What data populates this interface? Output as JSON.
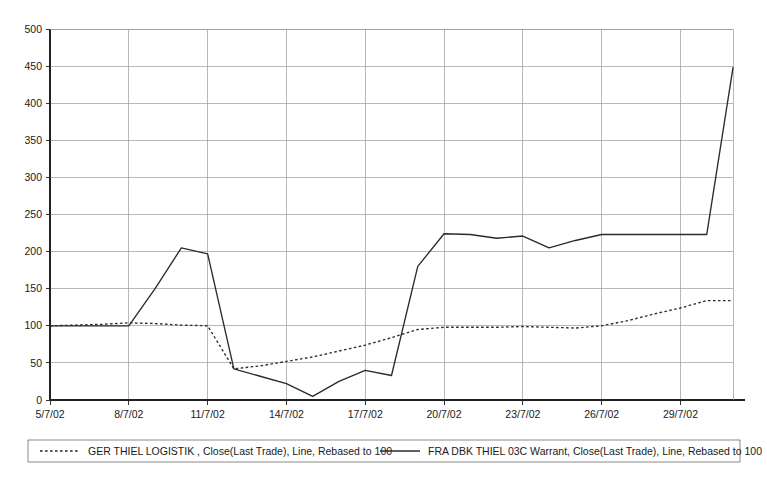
{
  "chart_data": {
    "type": "line",
    "title": "",
    "xlabel": "",
    "ylabel": "",
    "ylim": [
      0,
      500
    ],
    "ytick_step": 50,
    "grid": true,
    "legend_position": "bottom",
    "yticks": [
      "0",
      "50",
      "100",
      "150",
      "200",
      "250",
      "300",
      "350",
      "400",
      "450",
      "500"
    ],
    "x": [
      "5/7/02",
      "6/7/02",
      "7/7/02",
      "8/7/02",
      "9/7/02",
      "10/7/02",
      "11/7/02",
      "12/7/02",
      "13/7/02",
      "14/7/02",
      "15/7/02",
      "16/7/02",
      "17/7/02",
      "18/7/02",
      "19/7/02",
      "20/7/02",
      "21/7/02",
      "22/7/02",
      "23/7/02",
      "24/7/02",
      "25/7/02",
      "26/7/02",
      "27/7/02",
      "28/7/02",
      "29/7/02",
      "30/7/02",
      "31/7/02"
    ],
    "xticks": [
      "5/7/02",
      "8/7/02",
      "11/7/02",
      "14/7/02",
      "17/7/02",
      "20/7/02",
      "23/7/02",
      "26/7/02",
      "29/7/02"
    ],
    "xtick_indices": [
      0,
      3,
      6,
      9,
      12,
      15,
      18,
      21,
      24
    ],
    "series": [
      {
        "name": "GER THIEL LOGISTIK , Close(Last Trade), Line, Rebased to 100",
        "style": "dotted",
        "color": "#2b2b2b",
        "values": [
          100,
          101,
          102,
          104,
          103,
          101,
          100,
          42,
          46,
          52,
          58,
          66,
          74,
          84,
          95,
          98,
          98,
          98,
          99,
          98,
          97,
          100,
          107,
          116,
          124,
          134,
          134
        ]
      },
      {
        "name": "FRA DBK THIEL 03C Warrant, Close(Last Trade), Line, Rebased to 100",
        "style": "solid",
        "color": "#2b2b2b",
        "values": [
          100,
          100,
          100,
          100,
          150,
          205,
          197,
          42,
          32,
          22,
          5,
          25,
          40,
          33,
          180,
          224,
          223,
          218,
          221,
          205,
          215,
          223,
          223,
          223,
          223,
          223,
          448
        ]
      }
    ]
  },
  "legend": {
    "entries": [
      {
        "label": "GER THIEL LOGISTIK , Close(Last Trade), Line, Rebased to 100",
        "style": "dotted"
      },
      {
        "label": "FRA DBK THIEL 03C Warrant, Close(Last Trade), Line, Rebased to 100",
        "style": "solid"
      }
    ]
  }
}
